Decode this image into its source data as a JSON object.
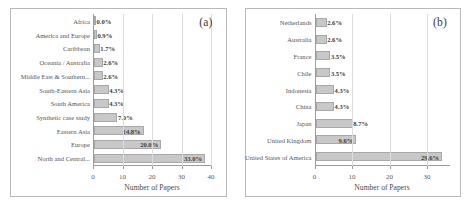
{
  "figure": {
    "panels": [
      {
        "tag": "(a)",
        "xlabel": "Number of Papers",
        "xticks": [
          "0",
          "10",
          "20",
          "30",
          "40"
        ]
      },
      {
        "tag": "(b)",
        "xlabel": "Number of Papers",
        "xticks": [
          "0",
          "10",
          "20",
          "30"
        ]
      }
    ]
  },
  "chart_data": [
    {
      "type": "bar",
      "title": "(a)",
      "orientation": "horizontal",
      "xlabel": "Number of Papers",
      "ylabel": "",
      "xlim": [
        0,
        40
      ],
      "xticks": [
        0,
        10,
        20,
        30,
        40
      ],
      "grid": true,
      "legend": "none",
      "categories": [
        "Africa",
        "America and Europe",
        "Caribbean",
        "Oceania / Australia",
        "Middle East & Southern...",
        "South-Eastern Asia",
        "South America",
        "Synthetic case study",
        "Eastern Asia",
        "Europe",
        "North and Central..."
      ],
      "values": [
        0.0,
        1.0,
        2.0,
        3.0,
        3.0,
        5.0,
        5.0,
        8.0,
        17.0,
        23.0,
        38.0
      ],
      "data_labels": [
        "0.0%",
        "0.9%",
        "1.7%",
        "2.6%",
        "2.6%",
        "4.3%",
        "4.3%",
        "7.0%",
        "14.8%",
        "20.0%",
        "33.0%"
      ],
      "percentages": [
        0.0,
        0.9,
        1.7,
        2.6,
        2.6,
        4.3,
        4.3,
        7.0,
        14.8,
        20.0,
        33.0
      ]
    },
    {
      "type": "bar",
      "title": "(b)",
      "orientation": "horizontal",
      "xlabel": "Number of Papers",
      "ylabel": "",
      "xlim": [
        0,
        36
      ],
      "xticks": [
        0,
        10,
        20,
        30
      ],
      "grid": true,
      "legend": "none",
      "categories": [
        "Netherlands",
        "Australia",
        "France",
        "Chile",
        "Indonesia",
        "China",
        "Japan",
        "United Kingdom",
        "United States of America"
      ],
      "values": [
        3.0,
        3.0,
        4.0,
        4.0,
        5.0,
        5.0,
        10.0,
        11.0,
        34.0
      ],
      "data_labels": [
        "2.6%",
        "2.6%",
        "3.5%",
        "3.5%",
        "4.3%",
        "4.3%",
        "8.7%",
        "9.6%",
        "29.6%"
      ],
      "percentages": [
        2.6,
        2.6,
        3.5,
        3.5,
        4.3,
        4.3,
        8.7,
        9.6,
        29.6
      ]
    }
  ],
  "style": {
    "bar_fill": "#c8c8c8",
    "bar_edge": "#a8a8a8",
    "grid_color": "#dcdcdc",
    "axis_color": "#9a9a9a",
    "text_color": "#565656"
  }
}
